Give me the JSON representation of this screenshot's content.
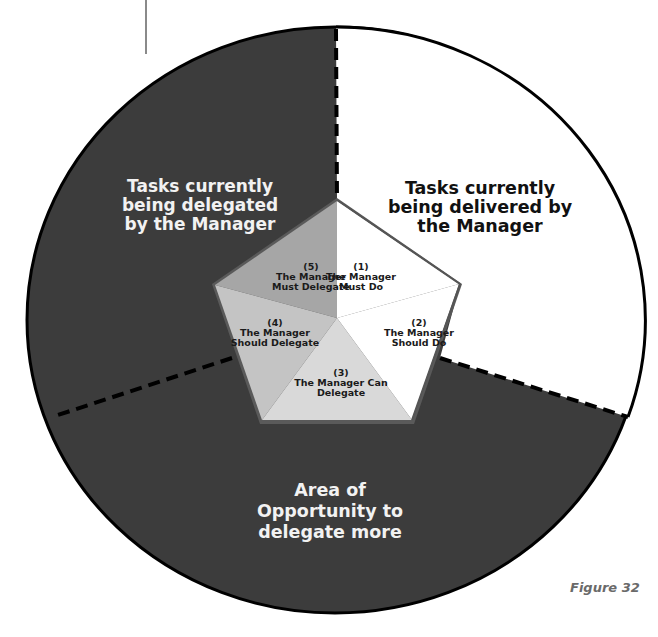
{
  "diagram": {
    "regions": {
      "delegated": {
        "line1": "Tasks currently",
        "line2": "being delegated",
        "line3": "by the Manager"
      },
      "delivered": {
        "line1": "Tasks currently",
        "line2": "being delivered by",
        "line3": "the Manager"
      },
      "opportunity": {
        "line1": "Area of",
        "line2": "Opportunity to",
        "line3": "delegate more"
      }
    },
    "segments": [
      {
        "number": "(1)",
        "line1": "The Manager",
        "line2": "Must Do",
        "color": "#ffffff"
      },
      {
        "number": "(2)",
        "line1": "The Manager",
        "line2": "Should Do",
        "color": "#ffffff"
      },
      {
        "number": "(3)",
        "line1": "The Manager Can",
        "line2": "Delegate",
        "color": "#d9d9d9"
      },
      {
        "number": "(4)",
        "line1": "The Manager",
        "line2": "Should Delegate",
        "color": "#c4c4c4"
      },
      {
        "number": "(5)",
        "line1": "The Manager",
        "line2": "Must Delegate",
        "color": "#a6a6a6"
      }
    ],
    "colors": {
      "dark_region": "#3c3c3c",
      "light_region": "#ffffff",
      "pentagon_rim": "#5a5a5a",
      "outline": "#000000"
    }
  },
  "caption": "Figure 32"
}
